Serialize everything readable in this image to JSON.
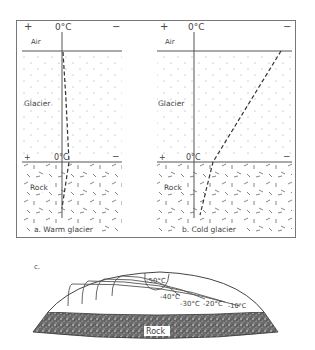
{
  "panel_a": {
    "plus": "+",
    "minus": "−",
    "zero_top": "0°C",
    "zero_bed": "0°C",
    "air": "Air",
    "glacier": "Glacier",
    "rock": "Rock",
    "caption": "a. Warm  glacier"
  },
  "panel_b": {
    "plus": "+",
    "minus": "−",
    "zero_top": "0°C",
    "zero_bed": "0°C",
    "air": "Air",
    "glacier": "Glacier",
    "rock": "Rock",
    "caption": "b. Cold  glacier"
  },
  "panel_c": {
    "label": "c.",
    "isotherms": [
      "-50°C",
      "-40°C",
      "-30°C",
      "-20°C",
      "-10°C"
    ],
    "rock": "Rock"
  },
  "colors": {
    "line": "#555555",
    "dots": "#9a9a9a",
    "rock": "#4a4a4a"
  }
}
